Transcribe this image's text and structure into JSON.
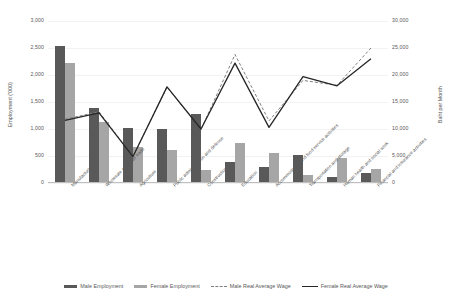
{
  "chart_data": {
    "type": "bar",
    "title": "",
    "subtitle": "",
    "xlabel": "",
    "ylabel": "Employment ('000)",
    "y2label": "Baht per Month",
    "ylim": [
      0,
      3000
    ],
    "y2lim": [
      0,
      30000
    ],
    "grid": true,
    "legend_position": "bottom",
    "y_ticks": [
      "0",
      "500",
      "1,000",
      "1,500",
      "2,000",
      "2,500",
      "3,000"
    ],
    "y_tick_values": [
      0,
      500,
      1000,
      1500,
      2000,
      2500,
      3000
    ],
    "y2_ticks": [
      "0",
      "5,000",
      "10,000",
      "15,000",
      "20,000",
      "25,000",
      "30,000"
    ],
    "y2_tick_values": [
      0,
      5000,
      10000,
      15000,
      20000,
      25000,
      30000
    ],
    "categories": [
      "Manufacturing",
      "Wholesale and retail trade",
      "Agriculture",
      "Public administration and defence",
      "Construction",
      "Education",
      "Accommodation and food service activities",
      "Transportation and storage",
      "Human health and social work",
      "Financial and insurance activities"
    ],
    "series": [
      {
        "name": "Male Employment",
        "type": "bar",
        "axis": "left",
        "unit": "'000",
        "color": "#595959",
        "values": [
          2530,
          1380,
          1010,
          1000,
          1270,
          390,
          300,
          520,
          120,
          180
        ]
      },
      {
        "name": "Female Employment",
        "type": "bar",
        "axis": "left",
        "unit": "'000",
        "color": "#a6a6a6",
        "values": [
          2220,
          1130,
          660,
          610,
          250,
          740,
          560,
          150,
          460,
          260
        ]
      },
      {
        "name": "Male Real Average Wage",
        "type": "line",
        "style": "dashed",
        "axis": "right",
        "unit": "Baht per Month",
        "color": "#7f7f7f",
        "values": [
          11800,
          13200,
          4900,
          17800,
          9900,
          23800,
          11500,
          19000,
          18100,
          25000
        ]
      },
      {
        "name": "Female Real Average Wage",
        "type": "line",
        "style": "solid",
        "axis": "right",
        "unit": "Baht per Month",
        "color": "#262626",
        "values": [
          11600,
          13000,
          4900,
          17800,
          10000,
          22200,
          10300,
          19700,
          18000,
          23000
        ]
      }
    ]
  }
}
